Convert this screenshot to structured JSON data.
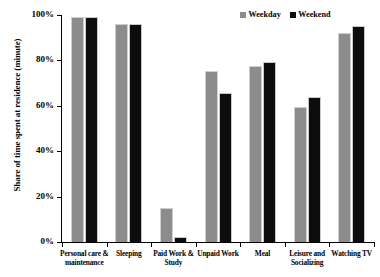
{
  "chart_data": {
    "type": "bar",
    "title": "",
    "subtitle": "",
    "xlabel": "",
    "ylabel": "Share of time spent at residence (minute)",
    "ylim": [
      0,
      100
    ],
    "yticks": [
      "0%",
      "20%",
      "40%",
      "60%",
      "80%",
      "100%"
    ],
    "ytick_values": [
      0,
      20,
      40,
      60,
      80,
      100
    ],
    "grid": false,
    "legend_position": "top-right",
    "categories": [
      "Personal care & maintenance",
      "Sleeping",
      "Paid Work & Study",
      "Unpaid Work",
      "Meal",
      "Leisure and Socializing",
      "Watching TV"
    ],
    "series": [
      {
        "name": "Weekday",
        "color": "#8c8c8c",
        "values": [
          99,
          96,
          15,
          75.5,
          77.5,
          59.5,
          92
        ]
      },
      {
        "name": "Weekend",
        "color": "#0d0d0d",
        "values": [
          99,
          96,
          2,
          65.5,
          79.5,
          64,
          95
        ]
      }
    ]
  },
  "legend": {
    "items": [
      {
        "label": "Weekday",
        "swatch": "weekday-swatch"
      },
      {
        "label": "Weekend",
        "swatch": "weekend-swatch"
      }
    ]
  },
  "axis": {
    "y_title": "Share of time spent at residence (minute)"
  }
}
